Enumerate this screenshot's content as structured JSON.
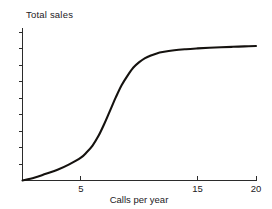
{
  "chart_data": {
    "type": "line",
    "title": "",
    "xlabel": "Calls per year",
    "ylabel": "Total sales",
    "xlim": [
      0,
      20
    ],
    "ylim": [
      0,
      1
    ],
    "grid": false,
    "legend": false,
    "legend_position": "none",
    "x_ticks": [
      0,
      1,
      2,
      3,
      4,
      5,
      6,
      7,
      8,
      9,
      10,
      11,
      12,
      13,
      14,
      15,
      16,
      17,
      18,
      19,
      20
    ],
    "x_tick_labels": [
      "",
      "",
      "",
      "",
      "",
      "5",
      "",
      "",
      "",
      "",
      "",
      "",
      "",
      "",
      "",
      "15",
      "",
      "",
      "",
      "",
      "20"
    ],
    "x_labeled_ticks": [
      {
        "value": 5,
        "label": "5"
      },
      {
        "value": 15,
        "label": "15"
      },
      {
        "value": 20,
        "label": "20"
      }
    ],
    "y_ticks_count": 9,
    "y_tick_labels": [
      "",
      "",
      "",
      "",
      "",
      "",
      "",
      "",
      ""
    ],
    "series": [
      {
        "name": "Total sales",
        "color": "#15120f",
        "x": [
          0.0,
          1.0,
          2.0,
          3.0,
          4.0,
          5.0,
          5.5,
          6.0,
          6.5,
          7.0,
          7.5,
          8.0,
          8.5,
          9.0,
          9.5,
          10.0,
          10.5,
          11.0,
          11.5,
          12.0,
          13.0,
          14.0,
          15.0,
          16.0,
          17.0,
          18.0,
          19.0,
          20.0
        ],
        "y": [
          0.0,
          0.02,
          0.05,
          0.08,
          0.12,
          0.17,
          0.21,
          0.26,
          0.33,
          0.42,
          0.52,
          0.62,
          0.71,
          0.78,
          0.84,
          0.88,
          0.91,
          0.93,
          0.945,
          0.955,
          0.968,
          0.976,
          0.982,
          0.987,
          0.991,
          0.994,
          0.997,
          1.0
        ]
      }
    ],
    "annotations": []
  },
  "labels": {
    "y_axis_title": "Total sales",
    "x_axis_title": "Calls per year"
  },
  "colors": {
    "curve": "#15120f",
    "axis": "#2b2b2b",
    "background": "#ffffff",
    "text": "#23201d"
  }
}
